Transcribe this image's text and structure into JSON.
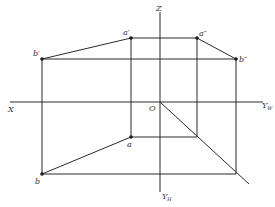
{
  "diagram": {
    "type": "orthographic-projection",
    "axes": {
      "x_label": "X",
      "z_label": "Z",
      "origin_label": "O",
      "yw_label": "Y",
      "yw_sub": "W",
      "yh_label": "Y",
      "yh_sub": "H"
    },
    "points": {
      "a_prime": "a′",
      "b_prime": "b′",
      "a_double_prime": "a″",
      "b_double_prime": "b″",
      "a": "a",
      "b": "b"
    },
    "colors": {
      "line": "#2a2a2a",
      "text": "#333333",
      "background": "#ffffff"
    }
  }
}
